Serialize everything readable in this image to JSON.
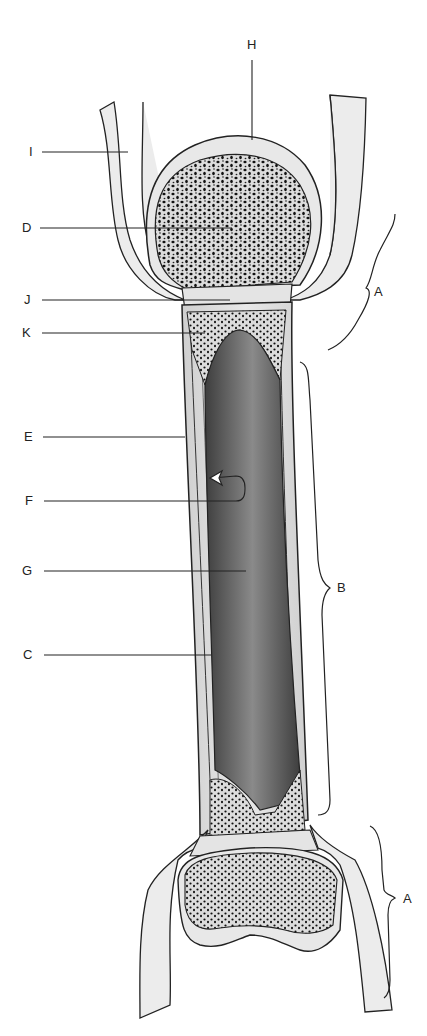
{
  "diagram": {
    "labels": {
      "A_top": "A",
      "A_bottom": "A",
      "B": "B",
      "C": "C",
      "D": "D",
      "E": "E",
      "F": "F",
      "G": "G",
      "H": "H",
      "I": "I",
      "J": "J",
      "K": "K"
    },
    "colors": {
      "outline": "#222222",
      "cartilage": "#e8e8e8",
      "compact_bone": "#d4d4d4",
      "marrow_cavity": "#6a6a6a",
      "spongy_holes": "#111111",
      "ligament": "#ececec"
    }
  }
}
